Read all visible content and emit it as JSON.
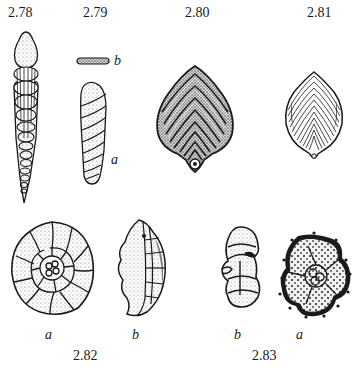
{
  "plate": {
    "figures": [
      {
        "id": "2.78",
        "label": "2.78",
        "subfigures": []
      },
      {
        "id": "2.79",
        "label": "2.79",
        "subfigures": [
          {
            "letter": "b"
          },
          {
            "letter": "a"
          }
        ]
      },
      {
        "id": "2.80",
        "label": "2.80",
        "subfigures": []
      },
      {
        "id": "2.81",
        "label": "2.81",
        "subfigures": []
      },
      {
        "id": "2.82",
        "label": "2.82",
        "subfigures": [
          {
            "letter": "a"
          },
          {
            "letter": "b"
          }
        ]
      },
      {
        "id": "2.83",
        "label": "2.83",
        "subfigures": [
          {
            "letter": "b"
          },
          {
            "letter": "a"
          }
        ]
      }
    ]
  },
  "colors": {
    "ink": "#1a1a1a",
    "paper": "#ffffff",
    "stipple": "#8a8a8a"
  }
}
